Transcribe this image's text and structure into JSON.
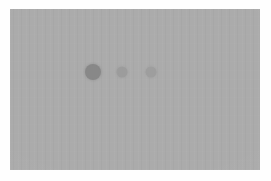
{
  "canvas": {
    "width": 271,
    "height": 181,
    "background_color": "#fefefe"
  },
  "panel": {
    "label": "blank-gray-panel",
    "x": 10,
    "y": 9,
    "width": 250,
    "height": 161,
    "fill_color": "#ababab",
    "texture": "vertical-compression-banding",
    "content_text": ""
  },
  "indicator": {
    "label": "three-dot-indicator",
    "alignment": "horizontal",
    "center_y": 63,
    "dot_count": 3,
    "dots": [
      {
        "name": "dot-1",
        "center_x": 83,
        "center_y": 63,
        "diameter": 16,
        "color": "#888888",
        "state": "active"
      },
      {
        "name": "dot-2",
        "center_x": 112,
        "center_y": 63,
        "diameter": 11,
        "color": "#9c9c9c",
        "state": "inactive"
      },
      {
        "name": "dot-3",
        "center_x": 141,
        "center_y": 63,
        "diameter": 11,
        "color": "#9e9e9e",
        "state": "inactive"
      }
    ]
  }
}
